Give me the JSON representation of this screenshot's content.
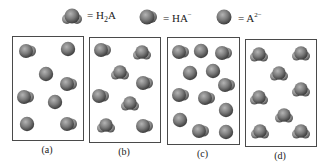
{
  "legend": [
    {
      "species": "H2A",
      "label_main": "= H",
      "label_sub": "2",
      "label_tail": "A",
      "label_sup": "",
      "glyph": "sphere-two-h"
    },
    {
      "species": "HA-",
      "label_main": "= HA",
      "label_sub": "",
      "label_tail": "",
      "label_sup": "−",
      "glyph": "sphere-one-h"
    },
    {
      "species": "A2-",
      "label_main": "= A",
      "label_sub": "",
      "label_tail": "",
      "label_sup": "2−",
      "glyph": "sphere"
    }
  ],
  "colors": {
    "sphere_dark": "#4a4a4a",
    "sphere_mid": "#7d7d7d",
    "sphere_light": "#a9a9a9",
    "box_border": "#4a4a4a",
    "background": "#ffffff"
  },
  "panels": [
    {
      "id": "a",
      "caption": "(a)",
      "box": {
        "x": 12,
        "y": 36,
        "w": 70,
        "h": 103
      },
      "molecules": [
        {
          "type": "HA-",
          "x": 14,
          "y": 14
        },
        {
          "type": "A2-",
          "x": 55,
          "y": 12
        },
        {
          "type": "A2-",
          "x": 33,
          "y": 37
        },
        {
          "type": "HA-",
          "x": 55,
          "y": 47
        },
        {
          "type": "HA-",
          "x": 12,
          "y": 60
        },
        {
          "type": "A2-",
          "x": 42,
          "y": 65
        },
        {
          "type": "A2-",
          "x": 14,
          "y": 87
        },
        {
          "type": "HA-",
          "x": 55,
          "y": 87
        }
      ],
      "counts": {
        "H2A": 0,
        "HA-": 4,
        "A2-": 4
      }
    },
    {
      "id": "b",
      "caption": "(b)",
      "box": {
        "x": 89,
        "y": 37,
        "w": 70,
        "h": 104
      },
      "molecules": [
        {
          "type": "HA-",
          "x": 12,
          "y": 12
        },
        {
          "type": "H2A",
          "x": 52,
          "y": 15
        },
        {
          "type": "H2A",
          "x": 30,
          "y": 35
        },
        {
          "type": "HA-",
          "x": 54,
          "y": 45
        },
        {
          "type": "HA-",
          "x": 10,
          "y": 58
        },
        {
          "type": "H2A",
          "x": 40,
          "y": 66
        },
        {
          "type": "H2A",
          "x": 16,
          "y": 88
        },
        {
          "type": "HA-",
          "x": 54,
          "y": 88
        }
      ],
      "counts": {
        "H2A": 4,
        "HA-": 4,
        "A2-": 0
      }
    },
    {
      "id": "c",
      "caption": "(c)",
      "box": {
        "x": 167,
        "y": 37,
        "w": 71,
        "h": 106
      },
      "molecules": [
        {
          "type": "HA-",
          "x": 12,
          "y": 14
        },
        {
          "type": "A2-",
          "x": 33,
          "y": 13
        },
        {
          "type": "HA-",
          "x": 55,
          "y": 15
        },
        {
          "type": "A2-",
          "x": 22,
          "y": 35
        },
        {
          "type": "A2-",
          "x": 45,
          "y": 33
        },
        {
          "type": "HA-",
          "x": 58,
          "y": 47
        },
        {
          "type": "HA-",
          "x": 12,
          "y": 57
        },
        {
          "type": "HA-",
          "x": 38,
          "y": 60
        },
        {
          "type": "A2-",
          "x": 58,
          "y": 72
        },
        {
          "type": "A2-",
          "x": 12,
          "y": 82
        },
        {
          "type": "HA-",
          "x": 32,
          "y": 93
        },
        {
          "type": "A2-",
          "x": 58,
          "y": 94
        }
      ],
      "counts": {
        "H2A": 0,
        "HA-": 6,
        "A2-": 6
      }
    },
    {
      "id": "d",
      "caption": "(d)",
      "box": {
        "x": 245,
        "y": 39,
        "w": 70,
        "h": 106
      },
      "molecules": [
        {
          "type": "H2A",
          "x": 13,
          "y": 15
        },
        {
          "type": "H2A",
          "x": 55,
          "y": 14
        },
        {
          "type": "H2A",
          "x": 33,
          "y": 34
        },
        {
          "type": "H2A",
          "x": 13,
          "y": 58
        },
        {
          "type": "H2A",
          "x": 55,
          "y": 50
        },
        {
          "type": "H2A",
          "x": 38,
          "y": 76
        },
        {
          "type": "H2A",
          "x": 14,
          "y": 92
        },
        {
          "type": "H2A",
          "x": 55,
          "y": 92
        }
      ],
      "counts": {
        "H2A": 8,
        "HA-": 0,
        "A2-": 0
      }
    }
  ]
}
